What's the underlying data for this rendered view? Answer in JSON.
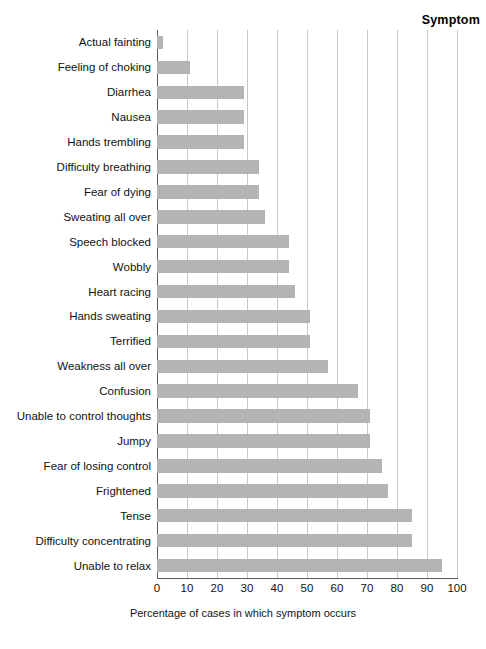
{
  "chart_data": {
    "type": "bar",
    "orientation": "horizontal",
    "title": "",
    "header_label": "Symptom",
    "xlabel": "Percentage of cases in which symptom occurs",
    "ylabel": "",
    "xlim": [
      0,
      100
    ],
    "xticks": [
      0,
      10,
      20,
      30,
      40,
      50,
      60,
      70,
      80,
      90,
      100
    ],
    "xtick_labels": [
      "0",
      "10",
      "20",
      "30",
      "40",
      "50",
      "60",
      "70",
      "80",
      "90",
      "100"
    ],
    "grid": true,
    "grid_axis": "x",
    "legend": false,
    "bar_color": "#b4b4b4",
    "axis_color": "#5a5a5a",
    "gridline_color": "#c9c9c9",
    "categories": [
      "Actual fainting",
      "Feeling of choking",
      "Diarrhea",
      "Nausea",
      "Hands trembling",
      "Difficulty breathing",
      "Fear of dying",
      "Sweating all over",
      "Speech blocked",
      "Wobbly",
      "Heart racing",
      "Hands sweating",
      "Terrified",
      "Weakness all over",
      "Confusion",
      "Unable to control thoughts",
      "Jumpy",
      "Fear of losing control",
      "Frightened",
      "Tense",
      "Difficulty concentrating",
      "Unable to relax"
    ],
    "values": [
      2,
      11,
      29,
      29,
      29,
      34,
      34,
      36,
      44,
      44,
      46,
      51,
      51,
      57,
      67,
      71,
      71,
      75,
      77,
      85,
      85,
      95
    ]
  }
}
